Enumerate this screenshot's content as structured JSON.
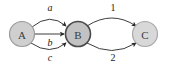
{
  "diagram": {
    "type": "directed-multigraph",
    "background_color": "#ffffff",
    "nodes": [
      {
        "id": "A",
        "label": "A",
        "cx": 22,
        "cy": 34,
        "r": 12.5,
        "fill": "#cfcfcf",
        "stroke": "#9a9a9a",
        "stroke_width": 1.2
      },
      {
        "id": "B",
        "label": "B",
        "cx": 78,
        "cy": 34,
        "r": 12.5,
        "fill": "#c2c2c2",
        "stroke": "#4a4a4a",
        "stroke_width": 1.6
      },
      {
        "id": "C",
        "label": "C",
        "cx": 145,
        "cy": 34,
        "r": 12.5,
        "fill": "#d8d8d8",
        "stroke": "#a8a8a8",
        "stroke_width": 1.2
      }
    ],
    "edges": [
      {
        "id": "a",
        "from": "A",
        "to": "B",
        "label": "a",
        "label_style": "italic",
        "label_x": 50,
        "label_y": 7,
        "curve": "up",
        "path": "M 32 27 Q 50 12 66 26",
        "stroke": "#3c3c3c"
      },
      {
        "id": "b",
        "from": "A",
        "to": "B",
        "label": "b",
        "label_style": "italic",
        "label_x": 50,
        "label_y": 42,
        "curve": "straight",
        "path": "M 35 34 L 64 34",
        "stroke": "#3c3c3c"
      },
      {
        "id": "c",
        "from": "A",
        "to": "B",
        "label": "c",
        "label_style": "italic",
        "label_x": 50,
        "label_y": 57,
        "curve": "down",
        "path": "M 31 43 Q 50 56 66 43",
        "stroke": "#3c3c3c"
      },
      {
        "id": "1",
        "from": "B",
        "to": "C",
        "label": "1",
        "label_style": "normal",
        "label_x": 113,
        "label_y": 7,
        "curve": "up",
        "path": "M 87 26 Q 112 10 136 26",
        "stroke": "#3c3c3c"
      },
      {
        "id": "2",
        "from": "B",
        "to": "C",
        "label": "2",
        "label_style": "normal",
        "label_x": 113,
        "label_y": 57,
        "curve": "down",
        "path": "M 87 43 Q 112 58 136 43",
        "stroke": "#3c3c3c"
      }
    ],
    "arrowhead_color": "#2a2a2a"
  }
}
